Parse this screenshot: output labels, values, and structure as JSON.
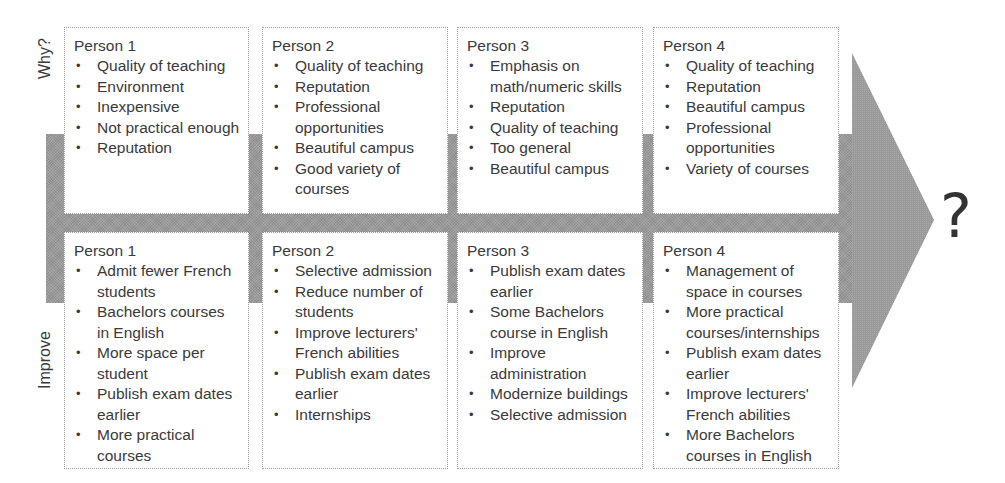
{
  "diagram": {
    "row_labels": {
      "top": "Why?",
      "bottom": "Improve"
    },
    "outcome_symbol": "?",
    "colors": {
      "band": "#9a9a9a",
      "text": "#3a3a3a",
      "box_border": "#9c9c9c",
      "box_fill": "#ffffff"
    },
    "why": [
      {
        "title": "Person 1",
        "items": [
          "Quality of teaching",
          "Environment",
          "Inexpensive",
          "Not practical enough",
          "Reputation"
        ]
      },
      {
        "title": "Person 2",
        "items": [
          "Quality of teaching",
          "Reputation",
          "Professional opportunities",
          "Beautiful campus",
          "Good variety of courses"
        ]
      },
      {
        "title": "Person 3",
        "items": [
          "Emphasis on math/numeric skills",
          "Reputation",
          "Quality of teaching",
          "Too general",
          "Beautiful campus"
        ]
      },
      {
        "title": "Person 4",
        "items": [
          "Quality of teaching",
          "Reputation",
          "Beautiful campus",
          "Professional opportunities",
          "Variety of courses"
        ]
      }
    ],
    "improve": [
      {
        "title": "Person 1",
        "items": [
          "Admit fewer French students",
          "Bachelors courses in English",
          "More space per student",
          "Publish exam dates earlier",
          "More practical courses"
        ]
      },
      {
        "title": "Person 2",
        "items": [
          "Selective admission",
          "Reduce number of students",
          "Improve lecturers' French abilities",
          "Publish exam dates earlier",
          "Internships"
        ]
      },
      {
        "title": "Person 3",
        "items": [
          "Publish exam dates earlier",
          "Some Bachelors course in English",
          "Improve administration",
          "Modernize buildings",
          "Selective admission"
        ]
      },
      {
        "title": "Person 4",
        "items": [
          "Management of space in courses",
          "More practical courses/internships",
          "Publish exam dates earlier",
          "Improve lecturers' French abilities",
          "More Bachelors courses in English"
        ]
      }
    ],
    "bullet_glyph": "•"
  }
}
